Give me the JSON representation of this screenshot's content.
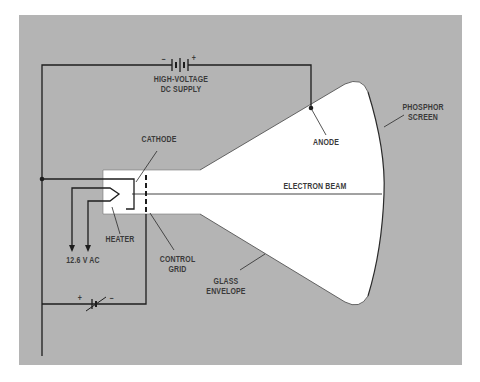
{
  "diagram": {
    "colors": {
      "panel": "#b4b4b4",
      "tube": "#ffffff",
      "line": "#2a2a2a",
      "text": "#3a3a3a"
    },
    "labels": {
      "hv_supply_line1": "HIGH-VOLTAGE",
      "hv_supply_line2": "DC SUPPLY",
      "hv_minus": "−",
      "hv_plus": "+",
      "cathode": "CATHODE",
      "anode": "ANODE",
      "phosphor_line1": "PHOSPHOR",
      "phosphor_line2": "SCREEN",
      "electron_beam": "ELECTRON BEAM",
      "heater": "HEATER",
      "heater_voltage": "12.6 V AC",
      "control_grid_line1": "CONTROL",
      "control_grid_line2": "GRID",
      "glass_line1": "GLASS",
      "glass_line2": "ENVELOPE",
      "bias_plus": "+",
      "bias_minus": "−"
    }
  }
}
